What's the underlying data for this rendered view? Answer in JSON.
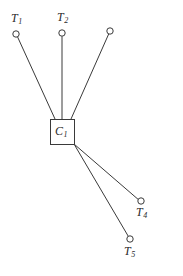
{
  "figure": {
    "name": "star-topology-diagram",
    "width": 183,
    "height": 276,
    "background_color": "#ffffff",
    "stroke_color": "#3a3a3a",
    "text_color": "#2b2b2b"
  },
  "center_node": {
    "label_text": "C",
    "label_sub": "1",
    "shape": "square",
    "x": 50,
    "y": 119,
    "width": 24,
    "height": 25,
    "label_x": 55,
    "label_y": 125
  },
  "terminal_nodes": [
    {
      "id": "t1",
      "label_text": "T",
      "label_sub": "1",
      "has_label": true,
      "cx": 16,
      "cy": 34,
      "r": 3.2,
      "label_x": 11,
      "label_y": 12
    },
    {
      "id": "t2",
      "label_text": "T",
      "label_sub": "2",
      "has_label": true,
      "cx": 62,
      "cy": 33,
      "r": 3.2,
      "label_x": 57,
      "label_y": 11
    },
    {
      "id": "t3",
      "label_text": "",
      "label_sub": "",
      "has_label": false,
      "cx": 110,
      "cy": 31,
      "r": 3.2,
      "label_x": 0,
      "label_y": 0
    },
    {
      "id": "t4",
      "label_text": "T",
      "label_sub": "4",
      "has_label": true,
      "cx": 141,
      "cy": 201,
      "r": 3.2,
      "label_x": 136,
      "label_y": 206
    },
    {
      "id": "t5",
      "label_text": "T",
      "label_sub": "5",
      "has_label": true,
      "cx": 130,
      "cy": 239,
      "r": 3.2,
      "label_x": 124,
      "label_y": 245
    }
  ],
  "edges": [
    {
      "id": "edge-c1-t1",
      "x1": 55,
      "y1": 119,
      "x2": 17.5,
      "y2": 36.8
    },
    {
      "id": "edge-c1-t2",
      "x1": 62,
      "y1": 119,
      "x2": 62,
      "y2": 36.2
    },
    {
      "id": "edge-c1-t3",
      "x1": 71,
      "y1": 119,
      "x2": 108.7,
      "y2": 34
    },
    {
      "id": "edge-c1-t4",
      "x1": 74,
      "y1": 144,
      "x2": 138.4,
      "y2": 199.6
    },
    {
      "id": "edge-c1-t5",
      "x1": 74,
      "y1": 144,
      "x2": 128.3,
      "y2": 236.3
    }
  ]
}
